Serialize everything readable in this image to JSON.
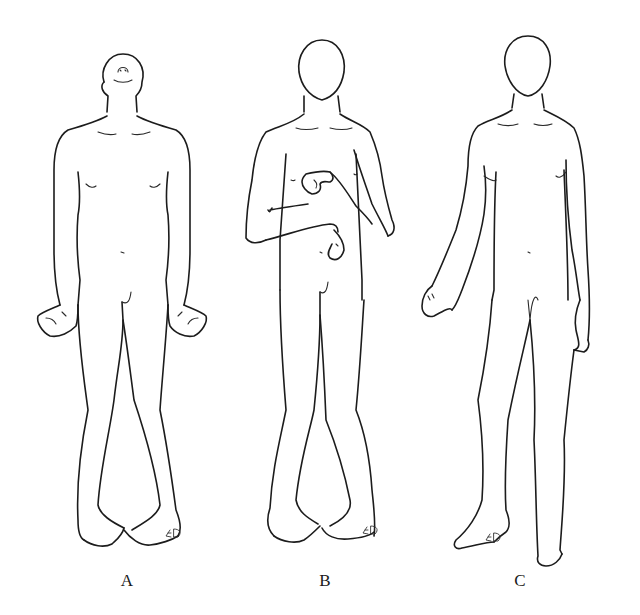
{
  "figure": {
    "background": "#ffffff",
    "line_color": "#1c1c1c",
    "panels": [
      {
        "id": "A",
        "label": "A",
        "pose": "head tilted back, arms at sides with flexed wrists, feet touching at heels",
        "signature": "ED"
      },
      {
        "id": "B",
        "label": "B",
        "pose": "arms flexed across chest with clenched hands, feet touching",
        "signature": "ED"
      },
      {
        "id": "C",
        "label": "C",
        "pose": "standing in stride, one arm swinging forward",
        "signature": "ED"
      }
    ]
  }
}
